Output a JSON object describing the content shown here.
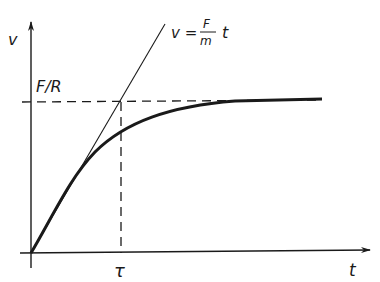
{
  "diagram": {
    "y_axis_label": "v",
    "x_axis_label": "t",
    "terminal_label": "F/R",
    "time_constant_label": "τ",
    "tangent_label": {
      "lhs": "v =",
      "numerator": "F",
      "denominator": "m",
      "rhs": "t"
    },
    "ink_color": "#1a1a1a"
  }
}
